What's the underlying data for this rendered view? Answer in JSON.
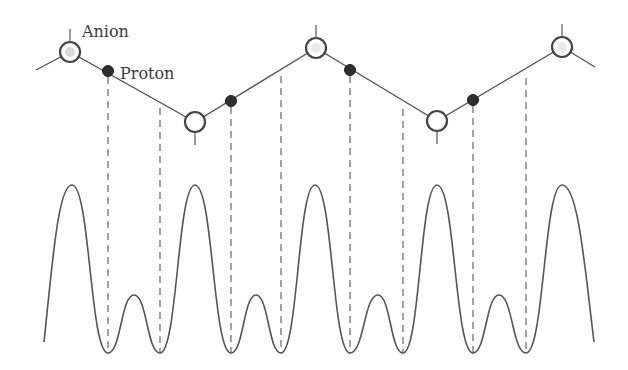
{
  "labels": {
    "anion": "Anion",
    "proton": "Proton"
  },
  "colors": {
    "line": "#555555",
    "anion_fill": "#ffffff",
    "anion_stroke": "#444444",
    "proton_fill": "#2e2e2e",
    "dash": "#666666"
  },
  "chain": {
    "anions": [
      {
        "x": 70,
        "y": 52,
        "position": "upper"
      },
      {
        "x": 195,
        "y": 122,
        "position": "lower"
      },
      {
        "x": 316,
        "y": 48,
        "position": "upper"
      },
      {
        "x": 437,
        "y": 121,
        "position": "lower"
      },
      {
        "x": 562,
        "y": 47,
        "position": "upper"
      }
    ],
    "protons": [
      {
        "x": 108,
        "y": 71
      },
      {
        "x": 231,
        "y": 101
      },
      {
        "x": 350,
        "y": 70
      },
      {
        "x": 473,
        "y": 100
      }
    ],
    "dashed_drops": [
      {
        "x": 108,
        "y_top": 71
      },
      {
        "x": 160,
        "y_top": 102
      },
      {
        "x": 231,
        "y_top": 101
      },
      {
        "x": 281,
        "y_top": 70
      },
      {
        "x": 350,
        "y_top": 70
      },
      {
        "x": 403,
        "y_top": 103
      },
      {
        "x": 473,
        "y_top": 100
      },
      {
        "x": 526,
        "y_top": 72
      }
    ],
    "dashed_bottom_y": 353
  },
  "potential_curve": {
    "baseline_min_y": 353,
    "big_peak_y": 185,
    "small_peak_y": 295,
    "big_peaks_x": [
      72,
      195,
      315,
      437,
      562
    ],
    "small_peaks_x": [
      134,
      256,
      378,
      499
    ],
    "minima_x": [
      108,
      160,
      231,
      281,
      350,
      403,
      473,
      526
    ],
    "start": {
      "x": 44,
      "y": 342
    },
    "end": {
      "x": 594,
      "y": 342
    }
  }
}
